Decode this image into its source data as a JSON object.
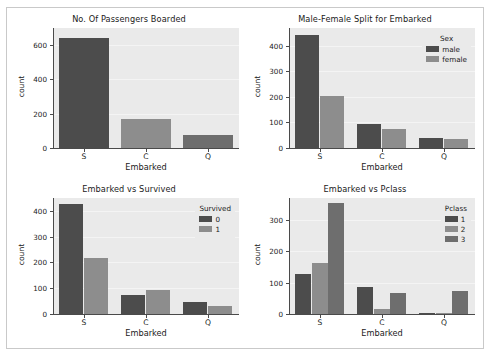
{
  "figure": {
    "background": "#ffffff",
    "axes_background": "#eaeaea",
    "border_color": "#c9c9c9",
    "rows": 2,
    "cols": 2
  },
  "palette": {
    "dark": "#4c4c4c",
    "medium": "#8d8d8d",
    "mid_dark": "#6e6e6e"
  },
  "chart_data": [
    {
      "type": "bar",
      "id": "passengers-boarded",
      "title": "No. Of Passengers Boarded",
      "xlabel": "Embarked",
      "ylabel": "count",
      "categories": [
        "S",
        "C",
        "Q"
      ],
      "values": [
        644,
        168,
        77
      ],
      "ylim": [
        0,
        700
      ],
      "yticks": [
        0,
        200,
        400,
        600
      ],
      "grid": true,
      "legend": null,
      "colors": [
        "#4c4c4c",
        "#8d8d8d",
        "#6e6e6e"
      ]
    },
    {
      "type": "bar",
      "id": "male-female-split",
      "title": "Male-Female Split for Embarked",
      "xlabel": "Embarked",
      "ylabel": "count",
      "categories": [
        "S",
        "C",
        "Q"
      ],
      "ylim": [
        0,
        470
      ],
      "yticks": [
        0,
        100,
        200,
        300,
        400
      ],
      "grid": true,
      "legend": {
        "title": "Sex",
        "position": "upper right",
        "entries": [
          "male",
          "female"
        ]
      },
      "series": [
        {
          "name": "male",
          "color": "#4c4c4c",
          "values": [
            441,
            95,
            41
          ]
        },
        {
          "name": "female",
          "color": "#8d8d8d",
          "values": [
            203,
            73,
            36
          ]
        }
      ]
    },
    {
      "type": "bar",
      "id": "embarked-vs-survived",
      "title": "Embarked vs Survived",
      "xlabel": "Embarked",
      "ylabel": "count",
      "categories": [
        "S",
        "C",
        "Q"
      ],
      "ylim": [
        0,
        450
      ],
      "yticks": [
        0,
        100,
        200,
        300,
        400
      ],
      "grid": true,
      "legend": {
        "title": "Survived",
        "position": "upper right",
        "entries": [
          "0",
          "1"
        ]
      },
      "series": [
        {
          "name": "0",
          "color": "#4c4c4c",
          "values": [
            427,
            75,
            47
          ]
        },
        {
          "name": "1",
          "color": "#8d8d8d",
          "values": [
            217,
            93,
            30
          ]
        }
      ]
    },
    {
      "type": "bar",
      "id": "embarked-vs-pclass",
      "title": "Embarked vs Pclass",
      "xlabel": "Embarked",
      "ylabel": "count",
      "categories": [
        "S",
        "C",
        "Q"
      ],
      "ylim": [
        0,
        370
      ],
      "yticks": [
        0,
        100,
        200,
        300
      ],
      "grid": true,
      "legend": {
        "title": "Pclass",
        "position": "upper right",
        "entries": [
          "1",
          "2",
          "3"
        ]
      },
      "series": [
        {
          "name": "1",
          "color": "#4c4c4c",
          "values": [
            127,
            85,
            2
          ]
        },
        {
          "name": "2",
          "color": "#8d8d8d",
          "values": [
            164,
            17,
            3
          ]
        },
        {
          "name": "3",
          "color": "#6e6e6e",
          "values": [
            353,
            66,
            72
          ]
        }
      ]
    }
  ]
}
